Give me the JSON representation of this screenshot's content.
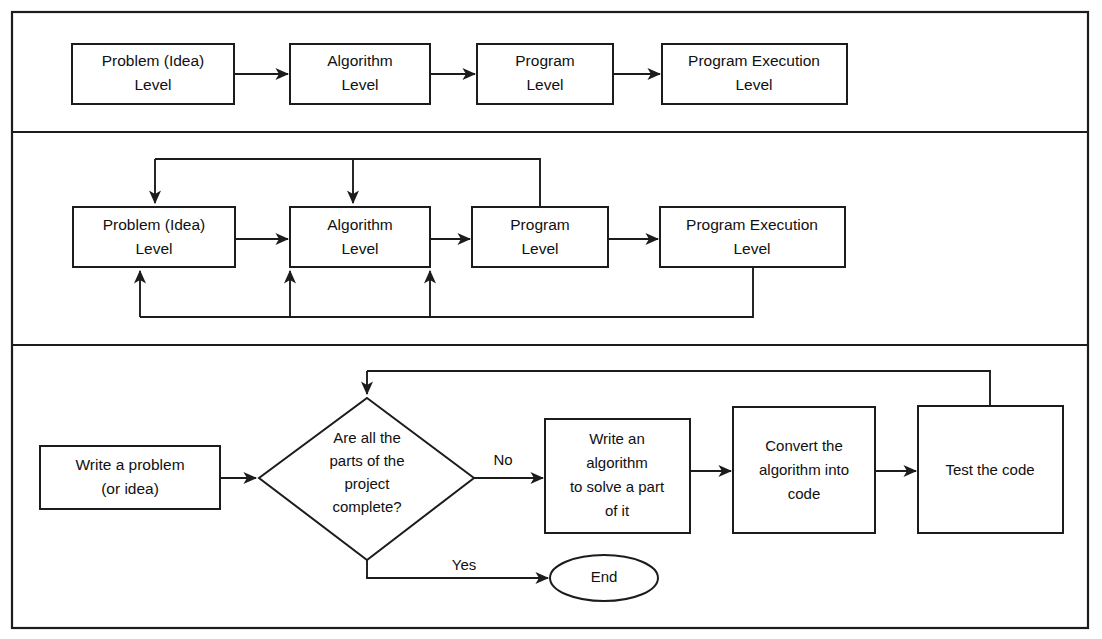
{
  "figure": {
    "background_color": "#ffffff",
    "line_color": "#1c1c1c",
    "text_color": "#101010",
    "width": 1102,
    "height": 639
  },
  "panel_top": {
    "name": "Linear development levels",
    "nodes": [
      {
        "id": "problem",
        "line1": "Problem (Idea)",
        "line2": "Level"
      },
      {
        "id": "algorithm",
        "line1": "Algorithm",
        "line2": "Level"
      },
      {
        "id": "program",
        "line1": "Program",
        "line2": "Level"
      },
      {
        "id": "execution",
        "line1": "Program Execution",
        "line2": "Level"
      }
    ],
    "connections": [
      {
        "from": "problem",
        "to": "algorithm",
        "label": ""
      },
      {
        "from": "algorithm",
        "to": "program",
        "label": ""
      },
      {
        "from": "program",
        "to": "execution",
        "label": ""
      }
    ]
  },
  "panel_middle": {
    "name": "Development levels with feedback loops",
    "nodes": [
      {
        "id": "problem",
        "line1": "Problem (Idea)",
        "line2": "Level"
      },
      {
        "id": "algorithm",
        "line1": "Algorithm",
        "line2": "Level"
      },
      {
        "id": "program",
        "line1": "Program",
        "line2": "Level"
      },
      {
        "id": "execution",
        "line1": "Program Execution",
        "line2": "Level"
      }
    ],
    "connections": [
      {
        "from": "problem",
        "to": "algorithm",
        "label": ""
      },
      {
        "from": "algorithm",
        "to": "program",
        "label": ""
      },
      {
        "from": "program",
        "to": "execution",
        "label": ""
      },
      {
        "from": "program",
        "to": "problem",
        "label": "top feedback"
      },
      {
        "from": "program",
        "to": "algorithm",
        "label": "top feedback"
      },
      {
        "from": "execution",
        "to": "problem",
        "label": "bottom feedback"
      },
      {
        "from": "execution",
        "to": "algorithm",
        "label": "bottom feedback"
      },
      {
        "from": "execution",
        "to": "program",
        "label": "bottom feedback"
      }
    ]
  },
  "panel_bottom": {
    "name": "Problem solving flowchart",
    "nodes": [
      {
        "id": "start",
        "shape": "rectangle",
        "lines": [
          "Write a problem",
          "(or idea)"
        ]
      },
      {
        "id": "decision",
        "shape": "diamond",
        "lines": [
          "Are all the",
          "parts of the",
          "project",
          "complete?"
        ]
      },
      {
        "id": "write-algorithm",
        "shape": "rectangle",
        "lines": [
          "Write an",
          "algorithm",
          "to solve a part",
          "of it"
        ]
      },
      {
        "id": "convert",
        "shape": "rectangle",
        "lines": [
          "Convert the",
          "algorithm into",
          "code"
        ]
      },
      {
        "id": "test",
        "shape": "rectangle",
        "lines": [
          "Test the code"
        ]
      },
      {
        "id": "end",
        "shape": "ellipse",
        "lines": [
          "End"
        ]
      }
    ],
    "edge_labels": {
      "no": "No",
      "yes": "Yes"
    },
    "connections": [
      {
        "from": "start",
        "to": "decision",
        "label": ""
      },
      {
        "from": "decision",
        "to": "write-algorithm",
        "label": "No"
      },
      {
        "from": "write-algorithm",
        "to": "convert",
        "label": ""
      },
      {
        "from": "convert",
        "to": "test",
        "label": ""
      },
      {
        "from": "test",
        "to": "decision",
        "label": "loop back"
      },
      {
        "from": "decision",
        "to": "end",
        "label": "Yes"
      }
    ]
  }
}
